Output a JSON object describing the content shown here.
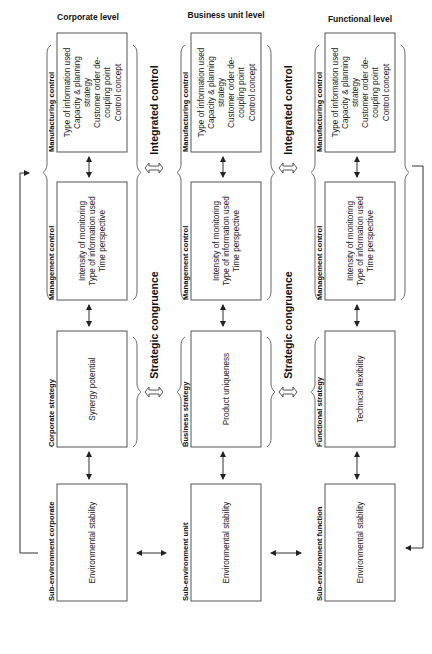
{
  "columns": [
    {
      "title": "Corporate level",
      "manufacturing": {
        "label": "Manufacturing control",
        "lines": [
          "Type of information used",
          "Capacity & planning",
          "strategy",
          "Customer order de-",
          "coupling point",
          "Control concept"
        ]
      },
      "management": {
        "label": "Management control",
        "lines": [
          "Intensity of monitoring",
          "Type of information used",
          "Time perspective"
        ]
      },
      "strategy": {
        "label": "Corporate strategy",
        "lines": [
          "Synergy potential"
        ]
      },
      "environment": {
        "label": "Sub-environment corporate",
        "lines": [
          "Environmental stability"
        ]
      }
    },
    {
      "title": "Business unit level",
      "manufacturing": {
        "label": "Manufacturing control",
        "lines": [
          "Type of information used",
          "Capacity & planning",
          "strategy",
          "Customer order de-",
          "coupling point",
          "Control concept"
        ]
      },
      "management": {
        "label": "Management control",
        "lines": [
          "Intensity of monitoring",
          "Type of information used",
          "Time perspective"
        ]
      },
      "strategy": {
        "label": "Business strategy",
        "lines": [
          "Product uniqueness"
        ]
      },
      "environment": {
        "label": "Sub-environment unit",
        "lines": [
          "Environmental stability"
        ]
      }
    },
    {
      "title": "Functional level",
      "manufacturing": {
        "label": "Manufacturing control",
        "lines": [
          "Type of information used",
          "Capacity & planning",
          "strategy",
          "Customer order de-",
          "coupling point",
          "Control concept"
        ]
      },
      "management": {
        "label": "Management control",
        "lines": [
          "Intensity of monitoring",
          "Type of information used",
          "Time perspective"
        ]
      },
      "strategy": {
        "label": "Functional strategy",
        "lines": [
          "Technical flexibility"
        ]
      },
      "environment": {
        "label": "Sub-environment function",
        "lines": [
          "Environmental stability"
        ]
      }
    }
  ],
  "connectors": {
    "integrated_control": "Integrated control",
    "strategic_congruence": "Strategic congruence"
  },
  "icons": {
    "vertical_arrow": "double-headed-arrow-vertical",
    "horizontal_arrow": "double-headed-arrow-horizontal",
    "hollow_arrow": "hollow-double-arrow",
    "feedback_arrow": "feedback-loop-arrow",
    "brace": "curly-brace"
  }
}
